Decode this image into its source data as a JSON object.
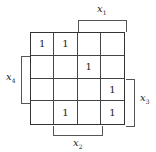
{
  "kmap": {
    "rows": [
      [
        "1",
        "1",
        "",
        ""
      ],
      [
        "",
        "",
        "1",
        ""
      ],
      [
        "",
        "",
        "",
        "1"
      ],
      [
        "",
        "1",
        "",
        "1"
      ]
    ],
    "labels": {
      "top": {
        "var": "x",
        "sub": "1"
      },
      "left": {
        "var": "x",
        "sub": "4"
      },
      "right": {
        "var": "x",
        "sub": "3"
      },
      "bottom": {
        "var": "x",
        "sub": "2"
      }
    }
  }
}
